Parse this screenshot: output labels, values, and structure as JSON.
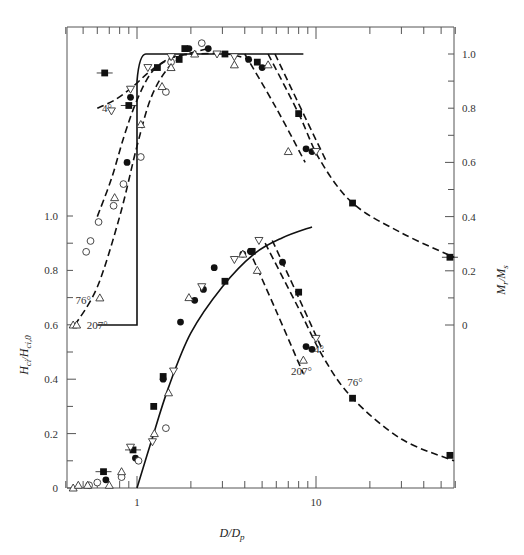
{
  "chart_data": {
    "type": "scatter",
    "title": "",
    "xlabel": "D/D_p",
    "ylabel_left": "H_ci/H_ci,0",
    "ylabel_right": "M_r/M_s",
    "xscale": "log",
    "xlim": [
      0.4,
      59
    ],
    "ylim_left": [
      0,
      1.0
    ],
    "ylim_right": [
      0,
      1.0
    ],
    "x_ticks": [
      {
        "value": 1,
        "label": "1"
      },
      {
        "value": 10,
        "label": "10"
      }
    ],
    "y_ticks_left": [
      {
        "value": 0,
        "label": "0"
      },
      {
        "value": 0.2,
        "label": "0.2"
      },
      {
        "value": 0.4,
        "label": "0.4"
      },
      {
        "value": 0.6,
        "label": "0.6"
      },
      {
        "value": 0.8,
        "label": "0.8"
      },
      {
        "value": 1.0,
        "label": "1.0"
      }
    ],
    "y_ticks_right": [
      {
        "value": 0,
        "label": "0"
      },
      {
        "value": 0.2,
        "label": "0.2"
      },
      {
        "value": 0.4,
        "label": "0.4"
      },
      {
        "value": 0.6,
        "label": "0.6"
      },
      {
        "value": 0.8,
        "label": "0.8"
      },
      {
        "value": 1.0,
        "label": "1.0"
      }
    ],
    "grid": false,
    "legend": "none (curves labeled inline by angle)",
    "annotations": [
      {
        "text": "4°",
        "panel": "upper",
        "x": 0.68,
        "y_right": 0.8
      },
      {
        "text": "76°",
        "panel": "upper",
        "x": 0.5,
        "y_left": 0.69
      },
      {
        "text": "207°",
        "panel": "upper",
        "x": 0.6,
        "y_left": 0.6
      },
      {
        "text": "4°",
        "panel": "lower",
        "x": 10.4,
        "y_left": 0.51
      },
      {
        "text": "207°",
        "panel": "lower",
        "x": 8.3,
        "y_left": 0.43
      },
      {
        "text": "76°",
        "panel": "lower",
        "x": 16.5,
        "y_left": 0.39
      }
    ],
    "series": [
      {
        "name": "M_r/M_s theory (solid)",
        "axis": "right",
        "style": "solid",
        "x": [
          1.0,
          1.0,
          1.03,
          1.08,
          1.2,
          1.5,
          3,
          5,
          8.5
        ],
        "y": [
          0.0,
          0.82,
          0.95,
          0.99,
          1.0,
          1.0,
          1.0,
          1.0,
          1.0
        ]
      },
      {
        "name": "M_r/M_s 4° (dashed)",
        "axis": "right",
        "style": "dashed",
        "x": [
          0.6,
          0.75,
          0.95,
          1.2,
          1.6,
          2.2,
          3.2,
          4.8
        ],
        "y": [
          0.8,
          0.83,
          0.88,
          0.94,
          0.99,
          1.0,
          1.0,
          0.97
        ]
      },
      {
        "name": "M_r/M_s 76° (dashed)",
        "axis": "right",
        "style": "dashed",
        "x": [
          0.6,
          0.72,
          0.85,
          1.0,
          1.2,
          1.5,
          1.9,
          2.5
        ],
        "y": [
          0.4,
          0.54,
          0.7,
          0.83,
          0.93,
          0.98,
          1.0,
          1.02
        ]
      },
      {
        "name": "M_r/M_s 207° (dashed)",
        "axis": "right",
        "style": "dashed",
        "x": [
          0.45,
          0.6,
          0.8,
          1.0,
          1.2,
          1.5,
          1.9
        ],
        "y": [
          0.0,
          0.14,
          0.4,
          0.66,
          0.84,
          0.95,
          1.0
        ]
      },
      {
        "name": "M_r/M_s decay 207° (dashed)",
        "axis": "right",
        "style": "dashed",
        "x": [
          4.0,
          6.0,
          8.7
        ],
        "y": [
          1.0,
          0.8,
          0.6
        ]
      },
      {
        "name": "M_r/M_s decay 76° (dashed)",
        "axis": "right",
        "style": "dashed",
        "x": [
          5.4,
          8.0,
          10.5,
          16.0,
          30.0,
          59.0
        ],
        "y": [
          1.0,
          0.78,
          0.61,
          0.45,
          0.34,
          0.25
        ]
      },
      {
        "name": "M_r/M_s decay 4° (dashed)",
        "axis": "right",
        "style": "dashed",
        "x": [
          5.9,
          8.5,
          11.5
        ],
        "y": [
          1.0,
          0.78,
          0.6
        ]
      },
      {
        "name": "H_ci theory (solid)",
        "axis": "left",
        "style": "solid",
        "x": [
          1.0,
          1.2,
          1.5,
          2.0,
          3.0,
          4.5,
          6.5,
          9.5
        ],
        "y": [
          0.0,
          0.17,
          0.37,
          0.57,
          0.74,
          0.86,
          0.92,
          0.96
        ]
      },
      {
        "name": "H_ci decay 207° (dashed)",
        "axis": "left",
        "style": "dashed",
        "x": [
          4.2,
          6.0,
          8.5
        ],
        "y": [
          0.88,
          0.65,
          0.42
        ]
      },
      {
        "name": "H_ci decay 76° (dashed)",
        "axis": "left",
        "style": "dashed",
        "x": [
          5.2,
          8.0,
          11.0,
          16.0,
          30.0,
          59.0
        ],
        "y": [
          0.9,
          0.66,
          0.48,
          0.33,
          0.18,
          0.1
        ]
      },
      {
        "name": "H_ci decay 4° (dashed)",
        "axis": "left",
        "style": "dashed",
        "x": [
          5.7,
          8.0,
          11.0
        ],
        "y": [
          0.91,
          0.7,
          0.5
        ]
      },
      {
        "name": "filled squares",
        "marker": "filled-square",
        "points": [
          {
            "x": 0.66,
            "y_right": 0.93
          },
          {
            "x": 0.9,
            "y_right": 0.81
          },
          {
            "x": 1.3,
            "y_right": 0.95
          },
          {
            "x": 1.72,
            "y_right": 0.98
          },
          {
            "x": 1.85,
            "y_right": 1.02
          },
          {
            "x": 3.1,
            "y_right": 1.0
          },
          {
            "x": 4.7,
            "y_right": 0.97
          },
          {
            "x": 8.0,
            "y_right": 0.78
          },
          {
            "x": 16.0,
            "y_right": 0.45
          },
          {
            "x": 56.0,
            "y_right": 0.25
          },
          {
            "x": 0.65,
            "y_left": 0.06
          },
          {
            "x": 0.95,
            "y_left": 0.14
          },
          {
            "x": 1.24,
            "y_left": 0.3
          },
          {
            "x": 1.4,
            "y_left": 0.41
          },
          {
            "x": 3.1,
            "y_left": 0.76
          },
          {
            "x": 4.4,
            "y_left": 0.87
          },
          {
            "x": 8.0,
            "y_left": 0.72
          },
          {
            "x": 16.0,
            "y_left": 0.33
          },
          {
            "x": 56.0,
            "y_left": 0.12
          }
        ]
      },
      {
        "name": "filled circles",
        "marker": "filled-circle",
        "points": [
          {
            "x": 0.92,
            "y_right": 0.84
          },
          {
            "x": 0.88,
            "y_right": 0.6
          },
          {
            "x": 1.95,
            "y_right": 1.02
          },
          {
            "x": 2.5,
            "y_right": 1.02
          },
          {
            "x": 4.2,
            "y_right": 0.98
          },
          {
            "x": 5.0,
            "y_right": 0.95
          },
          {
            "x": 8.8,
            "y_right": 0.65
          },
          {
            "x": 9.5,
            "y_right": 0.64
          },
          {
            "x": 0.67,
            "y_left": 0.03
          },
          {
            "x": 0.98,
            "y_left": 0.11
          },
          {
            "x": 1.4,
            "y_left": 0.4
          },
          {
            "x": 1.75,
            "y_left": 0.61
          },
          {
            "x": 2.1,
            "y_left": 0.69
          },
          {
            "x": 2.35,
            "y_left": 0.73
          },
          {
            "x": 2.7,
            "y_left": 0.81
          },
          {
            "x": 3.9,
            "y_left": 0.86
          },
          {
            "x": 4.3,
            "y_left": 0.87
          },
          {
            "x": 6.5,
            "y_left": 0.83
          },
          {
            "x": 8.8,
            "y_left": 0.52
          },
          {
            "x": 9.5,
            "y_left": 0.51
          }
        ]
      },
      {
        "name": "open circles",
        "marker": "open-circle",
        "points": [
          {
            "x": 1.55,
            "y_right": 0.97
          },
          {
            "x": 2.3,
            "y_right": 1.04
          },
          {
            "x": 1.45,
            "y_right": 0.86
          },
          {
            "x": 1.05,
            "y_right": 0.62
          },
          {
            "x": 0.84,
            "y_right": 0.52
          },
          {
            "x": 0.74,
            "y_right": 0.44
          },
          {
            "x": 0.61,
            "y_right": 0.38
          },
          {
            "x": 0.55,
            "y_right": 0.31
          },
          {
            "x": 0.52,
            "y_right": 0.27
          },
          {
            "x": 0.54,
            "y_left": 0.01
          },
          {
            "x": 0.6,
            "y_left": 0.02
          },
          {
            "x": 0.82,
            "y_left": 0.04
          },
          {
            "x": 1.02,
            "y_left": 0.1
          },
          {
            "x": 1.45,
            "y_left": 0.22
          }
        ]
      },
      {
        "name": "open triangles (up)",
        "marker": "open-triangle-up",
        "points": [
          {
            "x": 1.38,
            "y_right": 0.88
          },
          {
            "x": 1.55,
            "y_right": 0.95
          },
          {
            "x": 2.1,
            "y_right": 1.0
          },
          {
            "x": 3.5,
            "y_right": 0.96
          },
          {
            "x": 5.4,
            "y_right": 0.96
          },
          {
            "x": 7.0,
            "y_right": 0.64
          },
          {
            "x": 1.05,
            "y_right": 0.74
          },
          {
            "x": 0.75,
            "y_right": 0.47
          },
          {
            "x": 0.62,
            "y_right": 0.1
          },
          {
            "x": 0.44,
            "y_right": 0.0
          },
          {
            "x": 0.46,
            "y_right": 0.0
          },
          {
            "x": 0.44,
            "y_left": 0.0
          },
          {
            "x": 0.47,
            "y_left": 0.01
          },
          {
            "x": 0.53,
            "y_left": 0.01
          },
          {
            "x": 0.7,
            "y_left": 0.01
          },
          {
            "x": 0.82,
            "y_left": 0.06
          },
          {
            "x": 1.25,
            "y_left": 0.2
          },
          {
            "x": 1.5,
            "y_left": 0.35
          },
          {
            "x": 1.95,
            "y_left": 0.7
          },
          {
            "x": 3.9,
            "y_left": 0.86
          },
          {
            "x": 4.7,
            "y_left": 0.8
          },
          {
            "x": 8.5,
            "y_left": 0.47
          }
        ]
      },
      {
        "name": "open triangles (down)",
        "marker": "open-triangle-down",
        "points": [
          {
            "x": 0.72,
            "y_right": 0.79
          },
          {
            "x": 0.92,
            "y_right": 0.87
          },
          {
            "x": 1.15,
            "y_right": 0.95
          },
          {
            "x": 1.55,
            "y_right": 0.99
          },
          {
            "x": 2.8,
            "y_right": 1.0
          },
          {
            "x": 3.5,
            "y_right": 0.99
          },
          {
            "x": 10.0,
            "y_right": 0.64
          },
          {
            "x": 0.92,
            "y_left": 0.15
          },
          {
            "x": 1.22,
            "y_left": 0.17
          },
          {
            "x": 1.6,
            "y_left": 0.43
          },
          {
            "x": 2.3,
            "y_left": 0.74
          },
          {
            "x": 3.5,
            "y_left": 0.84
          },
          {
            "x": 4.8,
            "y_left": 0.91
          },
          {
            "x": 10.0,
            "y_left": 0.55
          }
        ]
      }
    ]
  }
}
